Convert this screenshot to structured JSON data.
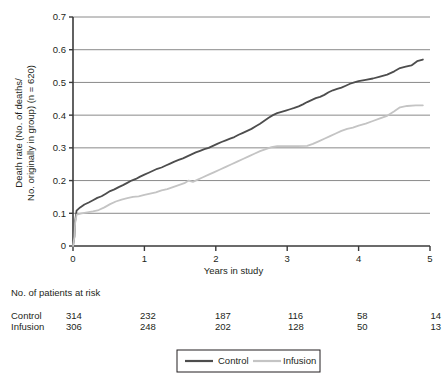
{
  "chart_data": {
    "type": "line",
    "title": "",
    "xlabel": "Years in study",
    "ylabel_line1": "Death rate (No. of deaths/",
    "ylabel_line2": "No. originally in group) (n = 620)",
    "xlim": [
      0,
      5
    ],
    "ylim": [
      0,
      0.7
    ],
    "xticks": [
      "0",
      "1",
      "2",
      "3",
      "4",
      "5"
    ],
    "xtick_values": [
      0,
      1,
      2,
      3,
      4,
      5
    ],
    "yticks": [
      "0",
      "0.1",
      "0.2",
      "0.3",
      "0.4",
      "0.5",
      "0.6",
      "0.7"
    ],
    "ytick_values": [
      0,
      0.1,
      0.2,
      0.3,
      0.4,
      0.5,
      0.6,
      0.7
    ],
    "grid": true,
    "grid_axis": "y",
    "legend_position": "bottom",
    "series": [
      {
        "name": "Control",
        "color": "#4d4d4d",
        "points": [
          [
            0.0,
            0.0
          ],
          [
            0.02,
            0.03
          ],
          [
            0.03,
            0.075
          ],
          [
            0.05,
            0.108
          ],
          [
            0.1,
            0.118
          ],
          [
            0.16,
            0.127
          ],
          [
            0.22,
            0.133
          ],
          [
            0.28,
            0.14
          ],
          [
            0.34,
            0.147
          ],
          [
            0.4,
            0.152
          ],
          [
            0.46,
            0.16
          ],
          [
            0.52,
            0.168
          ],
          [
            0.58,
            0.173
          ],
          [
            0.64,
            0.18
          ],
          [
            0.7,
            0.186
          ],
          [
            0.76,
            0.193
          ],
          [
            0.82,
            0.2
          ],
          [
            0.88,
            0.205
          ],
          [
            0.94,
            0.212
          ],
          [
            1.0,
            0.218
          ],
          [
            1.06,
            0.224
          ],
          [
            1.12,
            0.23
          ],
          [
            1.18,
            0.236
          ],
          [
            1.24,
            0.24
          ],
          [
            1.3,
            0.246
          ],
          [
            1.36,
            0.252
          ],
          [
            1.42,
            0.258
          ],
          [
            1.48,
            0.263
          ],
          [
            1.54,
            0.268
          ],
          [
            1.6,
            0.274
          ],
          [
            1.66,
            0.28
          ],
          [
            1.72,
            0.286
          ],
          [
            1.78,
            0.291
          ],
          [
            1.84,
            0.296
          ],
          [
            1.9,
            0.3
          ],
          [
            1.96,
            0.306
          ],
          [
            2.02,
            0.312
          ],
          [
            2.08,
            0.318
          ],
          [
            2.14,
            0.323
          ],
          [
            2.2,
            0.328
          ],
          [
            2.26,
            0.333
          ],
          [
            2.32,
            0.34
          ],
          [
            2.38,
            0.346
          ],
          [
            2.44,
            0.352
          ],
          [
            2.5,
            0.358
          ],
          [
            2.56,
            0.366
          ],
          [
            2.62,
            0.374
          ],
          [
            2.68,
            0.383
          ],
          [
            2.74,
            0.392
          ],
          [
            2.8,
            0.4
          ],
          [
            2.86,
            0.406
          ],
          [
            2.92,
            0.41
          ],
          [
            2.98,
            0.414
          ],
          [
            3.04,
            0.418
          ],
          [
            3.1,
            0.422
          ],
          [
            3.16,
            0.427
          ],
          [
            3.22,
            0.433
          ],
          [
            3.28,
            0.44
          ],
          [
            3.34,
            0.446
          ],
          [
            3.4,
            0.452
          ],
          [
            3.46,
            0.456
          ],
          [
            3.52,
            0.462
          ],
          [
            3.58,
            0.47
          ],
          [
            3.64,
            0.476
          ],
          [
            3.7,
            0.48
          ],
          [
            3.76,
            0.484
          ],
          [
            3.82,
            0.49
          ],
          [
            3.88,
            0.496
          ],
          [
            3.94,
            0.5
          ],
          [
            4.0,
            0.504
          ],
          [
            4.1,
            0.508
          ],
          [
            4.2,
            0.512
          ],
          [
            4.3,
            0.518
          ],
          [
            4.4,
            0.524
          ],
          [
            4.5,
            0.534
          ],
          [
            4.58,
            0.544
          ],
          [
            4.66,
            0.548
          ],
          [
            4.74,
            0.552
          ],
          [
            4.82,
            0.565
          ],
          [
            4.9,
            0.57
          ]
        ]
      },
      {
        "name": "Infusion",
        "color": "#c4c4c4",
        "points": [
          [
            0.0,
            0.0
          ],
          [
            0.02,
            0.028
          ],
          [
            0.03,
            0.07
          ],
          [
            0.05,
            0.096
          ],
          [
            0.12,
            0.1
          ],
          [
            0.2,
            0.103
          ],
          [
            0.28,
            0.106
          ],
          [
            0.36,
            0.11
          ],
          [
            0.44,
            0.118
          ],
          [
            0.52,
            0.128
          ],
          [
            0.6,
            0.136
          ],
          [
            0.68,
            0.142
          ],
          [
            0.76,
            0.146
          ],
          [
            0.84,
            0.15
          ],
          [
            0.92,
            0.152
          ],
          [
            1.0,
            0.156
          ],
          [
            1.08,
            0.16
          ],
          [
            1.16,
            0.164
          ],
          [
            1.24,
            0.17
          ],
          [
            1.32,
            0.174
          ],
          [
            1.4,
            0.18
          ],
          [
            1.48,
            0.186
          ],
          [
            1.56,
            0.192
          ],
          [
            1.62,
            0.2
          ],
          [
            1.68,
            0.196
          ],
          [
            1.74,
            0.202
          ],
          [
            1.82,
            0.21
          ],
          [
            1.9,
            0.218
          ],
          [
            1.98,
            0.226
          ],
          [
            2.06,
            0.234
          ],
          [
            2.14,
            0.242
          ],
          [
            2.22,
            0.25
          ],
          [
            2.3,
            0.258
          ],
          [
            2.38,
            0.266
          ],
          [
            2.46,
            0.274
          ],
          [
            2.54,
            0.282
          ],
          [
            2.62,
            0.29
          ],
          [
            2.7,
            0.296
          ],
          [
            2.78,
            0.302
          ],
          [
            2.86,
            0.305
          ],
          [
            3.0,
            0.305
          ],
          [
            3.14,
            0.305
          ],
          [
            3.28,
            0.306
          ],
          [
            3.36,
            0.312
          ],
          [
            3.44,
            0.32
          ],
          [
            3.52,
            0.328
          ],
          [
            3.6,
            0.336
          ],
          [
            3.68,
            0.344
          ],
          [
            3.76,
            0.352
          ],
          [
            3.84,
            0.358
          ],
          [
            3.92,
            0.362
          ],
          [
            4.0,
            0.368
          ],
          [
            4.1,
            0.374
          ],
          [
            4.2,
            0.382
          ],
          [
            4.3,
            0.39
          ],
          [
            4.4,
            0.398
          ],
          [
            4.5,
            0.412
          ],
          [
            4.58,
            0.424
          ],
          [
            4.68,
            0.428
          ],
          [
            4.8,
            0.43
          ],
          [
            4.9,
            0.43
          ]
        ]
      }
    ]
  },
  "risk_table": {
    "header": "No. of patients at risk",
    "rows": [
      {
        "label": "Control",
        "values": [
          "314",
          "232",
          "187",
          "116",
          "58",
          "14"
        ]
      },
      {
        "label": "Infusion",
        "values": [
          "306",
          "248",
          "202",
          "128",
          "50",
          "13"
        ]
      }
    ]
  },
  "legend": {
    "items": [
      {
        "label": "Control",
        "color": "#4d4d4d"
      },
      {
        "label": "Infusion",
        "color": "#c4c4c4"
      }
    ]
  },
  "colors": {
    "control": "#4d4d4d",
    "infusion": "#c4c4c4",
    "axis": "#3a3a3a",
    "grid": "#8a8a8a",
    "text": "#231f20"
  }
}
